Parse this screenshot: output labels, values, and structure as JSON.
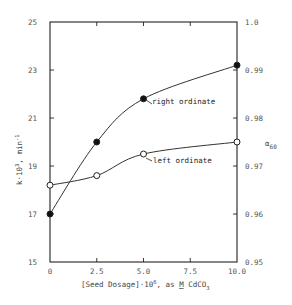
{
  "chart_data": {
    "type": "scatter",
    "title": "",
    "xlabel": "[Seed Dosage]·10^6, as M CdCO3",
    "ylabel_left": "k·10^3, min^-1",
    "ylabel_right": "α60",
    "xlim": [
      0,
      10.0
    ],
    "ylim_left": [
      15,
      25
    ],
    "ylim_right": [
      0.95,
      1.0
    ],
    "x_ticks": [
      "0",
      "2.5",
      "5.0",
      "7.5",
      "10.0"
    ],
    "y_ticks_left": [
      "15",
      "17",
      "19",
      "21",
      "23",
      "25"
    ],
    "y_ticks_right": [
      "0.95",
      "0.96",
      "0.97",
      "0.98",
      "0.99",
      "1.0"
    ],
    "grid": false,
    "series": [
      {
        "name": "left ordinate",
        "marker": "open-circle",
        "axis": "left",
        "x": [
          0,
          2.5,
          5.0,
          10.0
        ],
        "values": [
          18.2,
          18.6,
          19.5,
          20.0
        ]
      },
      {
        "name": "right ordinate",
        "marker": "filled-circle",
        "axis": "right",
        "x": [
          0,
          2.5,
          5.0,
          10.0
        ],
        "values": [
          0.96,
          0.975,
          0.984,
          0.991
        ]
      }
    ],
    "annotations": [
      {
        "text": "right ordinate",
        "points_to": "right ordinate series at x=5.0"
      },
      {
        "text": "left ordinate",
        "points_to": "left ordinate series at x=5.0"
      }
    ]
  },
  "labels": {
    "xlabel_main": "[Seed Dosage]·10",
    "xlabel_exp": "6",
    "xlabel_rest": ", as ",
    "xlabel_M": "M",
    "xlabel_cd": " CdCO",
    "xlabel_sub": "3",
    "ylabel_left_main": "k·10",
    "ylabel_left_exp": "3",
    "ylabel_left_unit": ", min",
    "ylabel_left_unit_exp": "-1",
    "ylabel_right_main": "α",
    "ylabel_right_sub": "60",
    "annot_right": "right ordinate",
    "annot_left": "left ordinate"
  }
}
